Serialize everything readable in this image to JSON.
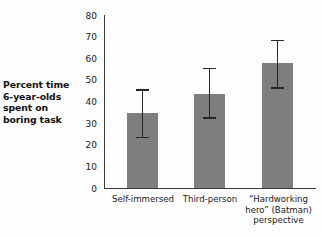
{
  "chart_data": {
    "type": "bar",
    "title": "",
    "xlabel": "",
    "ylabel": "Percent time 6-year-olds spent on boring task",
    "ylabel_lines": [
      "Percent time",
      "6-year-olds",
      "spent on",
      "boring task"
    ],
    "categories": [
      "Self-immersed",
      "Third-person",
      "“Hardworking hero” (Batman) perspective"
    ],
    "category_label_lines": [
      [
        "Self-immersed"
      ],
      [
        "Third-person"
      ],
      [
        "“Hardworking",
        "hero” (Batman)",
        "perspective"
      ]
    ],
    "values": [
      35,
      44,
      58
    ],
    "error_low": [
      24,
      33,
      47
    ],
    "error_high": [
      46,
      56,
      69
    ],
    "ylim": [
      0,
      80
    ],
    "yticks": [
      0,
      10,
      20,
      30,
      40,
      50,
      60,
      70,
      80
    ],
    "ytick_labels": [
      "0",
      "10",
      "20",
      "30",
      "40",
      "50",
      "60",
      "70",
      "80"
    ],
    "grid": false,
    "legend": false,
    "bar_color": "#7e7e7e",
    "error_color": "#262626",
    "axis_color": "#3a3a3a",
    "background_color": "#fdfdfd"
  }
}
